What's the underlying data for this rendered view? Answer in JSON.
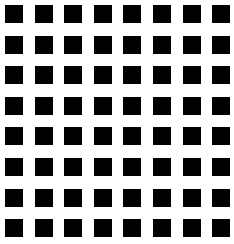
{
  "grid": {
    "rows": 8,
    "cols": 8,
    "origin_x": 5,
    "origin_y": 5,
    "pitch_x": 29.6,
    "pitch_y": 30.6,
    "square_size": 18,
    "square_color": "#000000",
    "background": "#ffffff"
  }
}
